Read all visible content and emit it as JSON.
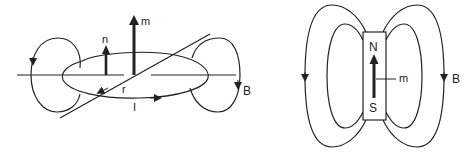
{
  "left_figure": {
    "title": "current loop",
    "labels": {
      "magnetic_moment": "m",
      "normal": "n",
      "radius": "r",
      "current": "I",
      "field": "B"
    }
  },
  "right_figure": {
    "title": "bar magnet",
    "labels": {
      "north": "N",
      "south": "S",
      "magnetic_moment": "m",
      "field": "B"
    }
  },
  "colors": {
    "line": "#222222",
    "background": "#ffffff"
  }
}
